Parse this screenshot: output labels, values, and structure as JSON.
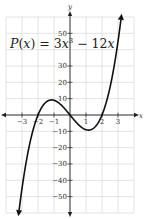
{
  "chart_data": {
    "type": "line",
    "title_parts": {
      "func": "P",
      "var": "x",
      "eq": " = 3",
      "x1": "x",
      "exp": "3",
      "rest": " − 12",
      "x2": "x"
    },
    "function": "3x^3 - 12x",
    "xlabel": "x",
    "ylabel": "y",
    "xlim": [
      -4,
      4
    ],
    "ylim": [
      -60,
      60
    ],
    "grid": true,
    "x_ticks": [
      -3,
      -2,
      -1,
      1,
      2,
      3
    ],
    "x_tick_labels": [
      "−3",
      "−2",
      "−1",
      "1",
      "2",
      "3"
    ],
    "y_ticks": [
      50,
      30,
      20,
      10,
      -10,
      -20,
      -30,
      -40,
      -50
    ],
    "y_tick_labels": [
      "50",
      "30",
      "20",
      "10",
      "−10",
      "−20",
      "−30",
      "−40",
      "−50"
    ],
    "series": [
      {
        "name": "P(x)",
        "x": [
          -3.3,
          -3,
          -2.5,
          -2,
          -1.5,
          -1.414,
          -1,
          -0.5,
          0,
          0.5,
          1,
          1.414,
          1.5,
          2,
          2.5,
          3,
          3.3
        ],
        "values": [
          -68.2,
          -45,
          -16.9,
          0,
          7.9,
          11.3,
          9,
          5.6,
          0,
          -5.6,
          -9,
          -11.3,
          -7.9,
          0,
          16.9,
          45,
          68.2
        ]
      }
    ],
    "annotations": [
      "arrow at upper end of curve",
      "arrow at lower end of curve",
      "axis arrows on both axes"
    ],
    "colors": {
      "curve": "#111111",
      "grid": "#d8d8d8",
      "axis": "#222222"
    }
  }
}
